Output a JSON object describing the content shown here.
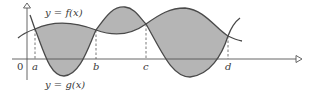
{
  "diagram": {
    "type": "area-between-curves",
    "curves": [
      {
        "name": "f",
        "label": "y = f(x)"
      },
      {
        "name": "g",
        "label": "y = g(x)"
      }
    ],
    "origin_label": "0",
    "intersection_labels": [
      "a",
      "b",
      "c",
      "d"
    ],
    "colors": {
      "shade": "#b5b5b5",
      "curve": "#4a4a4a",
      "axis": "#555555",
      "background": "#ffffff"
    }
  }
}
